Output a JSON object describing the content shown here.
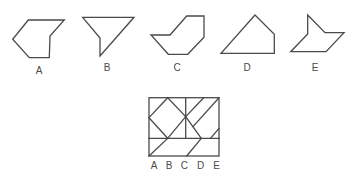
{
  "options": [
    {
      "label": "A",
      "points": "28.3,20 64.3,20 50,36 49.3,57.7 29.3,57.7 12.7,39.3",
      "label_x": 39,
      "label_y": 74
    },
    {
      "label": "B",
      "points": "82.7,17.3 134,17.3 100,56 100,38",
      "label_x": 107,
      "label_y": 71
    },
    {
      "label": "C",
      "points": "186.7,16 204,16 204,37.3 187.7,54.3 168.3,54.3 151,35 170,35",
      "label_x": 177,
      "label_y": 71
    },
    {
      "label": "D",
      "points": "255,15 274.3,34.3 274.3,53.3 221,53.3",
      "label_x": 247,
      "label_y": 71
    },
    {
      "label": "E",
      "points": "307.7,15 325,32.7 344,32.7 326,51.7 290.7,51.7 307.7,34",
      "label_x": 315,
      "label_y": 71
    }
  ],
  "composite": {
    "frame": {
      "x": 149,
      "y": 97.7,
      "width": 70,
      "height": 58.3
    },
    "lines": [
      [
        149,
        138.3,
        219,
        138.3
      ],
      [
        185.7,
        97.7,
        185.7,
        138.3
      ],
      [
        167.7,
        97.7,
        149,
        117.7
      ],
      [
        167.7,
        97.7,
        185.7,
        116.7
      ],
      [
        149,
        117.7,
        167.7,
        138.3
      ],
      [
        185.7,
        116.7,
        167.7,
        138.3
      ],
      [
        167.7,
        138.3,
        149,
        156
      ],
      [
        185.7,
        116.7,
        203.7,
        97.7
      ],
      [
        185.7,
        116.7,
        201.3,
        138.3
      ],
      [
        193,
        126.7,
        219,
        97.7
      ],
      [
        201.3,
        138.3,
        186.7,
        156
      ],
      [
        210.5,
        138.3,
        219,
        128.3
      ]
    ],
    "labels": [
      {
        "text": "A",
        "x": 154
      },
      {
        "text": "B",
        "x": 169
      },
      {
        "text": "C",
        "x": 184.3
      },
      {
        "text": "D",
        "x": 200.7
      },
      {
        "text": "E",
        "x": 216.7
      }
    ],
    "label_y": 169
  }
}
